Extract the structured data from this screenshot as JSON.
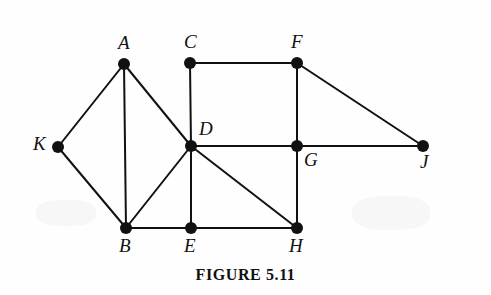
{
  "figure": {
    "caption": "FIGURE 5.11",
    "background_color": "#fefefe",
    "ink_color": "#111111"
  },
  "graph": {
    "vertex_radius": 6,
    "edge_width": 2,
    "vertices": [
      {
        "id": "A",
        "label": "A",
        "x": 124,
        "y": 64,
        "label_x": 118,
        "label_y": 33
      },
      {
        "id": "C",
        "label": "C",
        "x": 190,
        "y": 63,
        "label_x": 184,
        "label_y": 32
      },
      {
        "id": "F",
        "label": "F",
        "x": 297,
        "y": 63,
        "label_x": 291,
        "label_y": 32
      },
      {
        "id": "K",
        "label": "K",
        "x": 58,
        "y": 147,
        "label_x": 33,
        "label_y": 134
      },
      {
        "id": "D",
        "label": "D",
        "x": 191,
        "y": 146,
        "label_x": 199,
        "label_y": 119
      },
      {
        "id": "G",
        "label": "G",
        "x": 297,
        "y": 146,
        "label_x": 304,
        "label_y": 150
      },
      {
        "id": "J",
        "label": "J",
        "x": 423,
        "y": 146,
        "label_x": 420,
        "label_y": 152
      },
      {
        "id": "B",
        "label": "B",
        "x": 126,
        "y": 228,
        "label_x": 119,
        "label_y": 236
      },
      {
        "id": "E",
        "label": "E",
        "x": 191,
        "y": 228,
        "label_x": 184,
        "label_y": 236
      },
      {
        "id": "H",
        "label": "H",
        "x": 297,
        "y": 228,
        "label_x": 289,
        "label_y": 236
      }
    ],
    "edges": [
      {
        "from": "A",
        "to": "K"
      },
      {
        "from": "A",
        "to": "B"
      },
      {
        "from": "A",
        "to": "D"
      },
      {
        "from": "K",
        "to": "B"
      },
      {
        "from": "C",
        "to": "F"
      },
      {
        "from": "C",
        "to": "D"
      },
      {
        "from": "F",
        "to": "G"
      },
      {
        "from": "F",
        "to": "J"
      },
      {
        "from": "D",
        "to": "G"
      },
      {
        "from": "D",
        "to": "B"
      },
      {
        "from": "D",
        "to": "E"
      },
      {
        "from": "D",
        "to": "H"
      },
      {
        "from": "G",
        "to": "J"
      },
      {
        "from": "G",
        "to": "H"
      },
      {
        "from": "B",
        "to": "E"
      },
      {
        "from": "E",
        "to": "H"
      }
    ]
  }
}
